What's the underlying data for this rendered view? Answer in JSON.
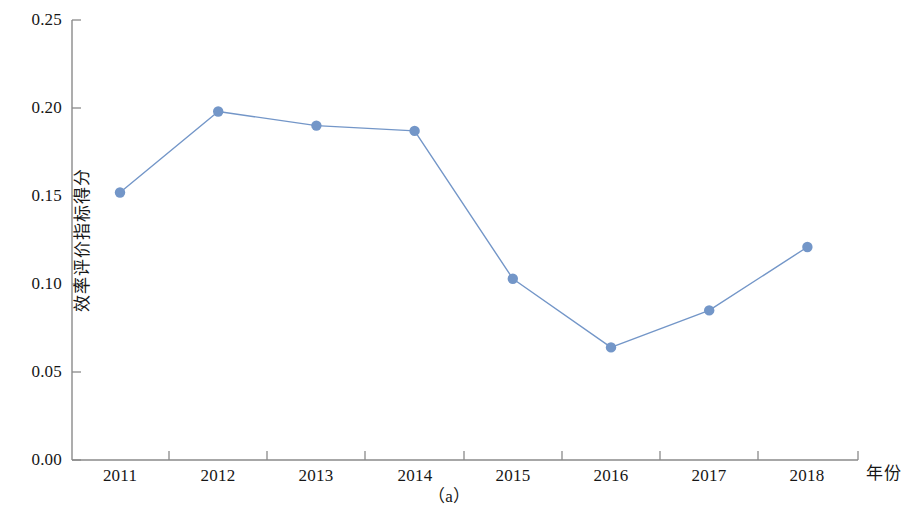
{
  "figure": {
    "caption": "（a）",
    "background_color": "#ffffff"
  },
  "chart_data": {
    "type": "line",
    "title": "",
    "subtitle": "",
    "xlabel": "年份",
    "ylabel": "效率评价指标得分",
    "caption": "（a）",
    "categories": [
      "2011",
      "2012",
      "2013",
      "2014",
      "2015",
      "2016",
      "2017",
      "2018"
    ],
    "x": [
      2011,
      2012,
      2013,
      2014,
      2015,
      2016,
      2017,
      2018
    ],
    "values": [
      0.152,
      0.198,
      0.19,
      0.187,
      0.103,
      0.064,
      0.085,
      0.121
    ],
    "series": [
      {
        "name": "效率评价指标得分",
        "values": [
          0.152,
          0.198,
          0.19,
          0.187,
          0.103,
          0.064,
          0.085,
          0.121
        ],
        "color": "#7396c8",
        "marker": "circle",
        "line_width": 1.3
      }
    ],
    "ylim": [
      0.0,
      0.25
    ],
    "yticks": [
      0.0,
      0.05,
      0.1,
      0.15,
      0.2,
      0.25
    ],
    "ytick_labels": [
      "0.00",
      "0.05",
      "0.10",
      "0.15",
      "0.20",
      "0.25"
    ],
    "xtick_labels": [
      "2011",
      "2012",
      "2013",
      "2014",
      "2015",
      "2016",
      "2017",
      "2018"
    ],
    "grid": false,
    "legend": null,
    "legend_position": "none",
    "axis_color": "#8a8a8a",
    "tick_direction": "in"
  },
  "axes": {
    "y_title": "效率评价指标得分",
    "x_title": "年份",
    "y_tick_labels": [
      "0.25",
      "0.20",
      "0.15",
      "0.10",
      "0.05",
      "0.00"
    ],
    "x_tick_labels": [
      "2011",
      "2012",
      "2013",
      "2014",
      "2015",
      "2016",
      "2017",
      "2018"
    ]
  },
  "colors": {
    "series": "#7396c8",
    "axis": "#8a8a8a",
    "text": "#161616"
  }
}
